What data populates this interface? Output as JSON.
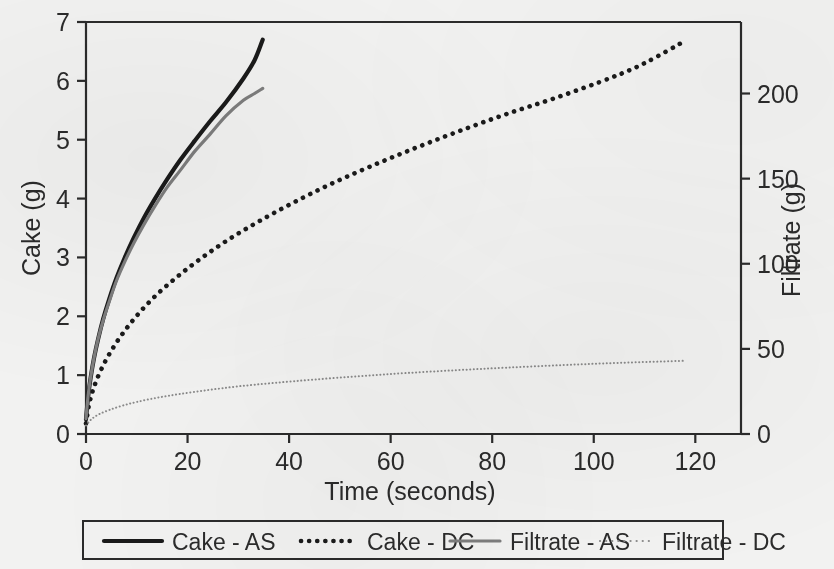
{
  "chart_data": {
    "type": "line",
    "title": "",
    "xlabel": "Time (seconds)",
    "ylabel": "Cake (g)",
    "y2label": "Filtrate (g)",
    "xlim": [
      0,
      129
    ],
    "ylim": [
      0,
      7
    ],
    "y2lim": [
      0,
      242
    ],
    "xticks": [
      0,
      20,
      40,
      60,
      80,
      100,
      120
    ],
    "yticks": [
      0,
      1,
      2,
      3,
      4,
      5,
      6,
      7
    ],
    "y2ticks": [
      0,
      50,
      100,
      150,
      200
    ],
    "grid": false,
    "legend_position": "bottom",
    "series": [
      {
        "name": "Cake - AS",
        "axis": "left",
        "style": "solid",
        "color": "#1a1a1a",
        "width": 4.2,
        "x": [
          0,
          0.4,
          0.9,
          1.6,
          2.4,
          3.4,
          4.6,
          6.0,
          7.6,
          9.4,
          11.4,
          13.6,
          16.0,
          18.6,
          21.4,
          24.4,
          27.6,
          31.0,
          33.2,
          34.8
        ],
        "y": [
          0.25,
          0.62,
          0.95,
          1.3,
          1.62,
          1.96,
          2.3,
          2.65,
          2.99,
          3.33,
          3.67,
          4.0,
          4.33,
          4.66,
          4.98,
          5.31,
          5.64,
          6.04,
          6.35,
          6.7
        ]
      },
      {
        "name": "Cake - DC",
        "axis": "left",
        "style": "dotted",
        "color": "#1a1a1a",
        "width": 4.6,
        "x": [
          0,
          0.6,
          1.5,
          2.8,
          4.6,
          7.0,
          10.0,
          13.6,
          17.8,
          22.6,
          28.0,
          34.0,
          40.6,
          47.8,
          55.6,
          64.0,
          73.0,
          82.6,
          92.8,
          103.6,
          110.0,
          118.0
        ],
        "y": [
          0.18,
          0.5,
          0.78,
          1.06,
          1.36,
          1.68,
          2.01,
          2.34,
          2.66,
          2.98,
          3.3,
          3.61,
          3.92,
          4.23,
          4.53,
          4.83,
          5.13,
          5.43,
          5.72,
          6.06,
          6.3,
          6.68
        ]
      },
      {
        "name": "Filtrate - AS",
        "axis": "right",
        "style": "solid",
        "color": "#7d7d7d",
        "width": 3.2,
        "x": [
          0,
          0.4,
          0.9,
          1.6,
          2.4,
          3.4,
          4.6,
          6.0,
          7.6,
          9.4,
          11.4,
          13.6,
          16.0,
          18.6,
          21.4,
          24.4,
          27.6,
          31.0,
          33.2,
          34.8
        ],
        "y": [
          9,
          22,
          33,
          45,
          56,
          67,
          78,
          90,
          101,
          112,
          123,
          134,
          145,
          155,
          166,
          176,
          187,
          196,
          200,
          203
        ]
      },
      {
        "name": "Filtrate - DC",
        "axis": "right",
        "style": "dotted",
        "color": "#8a8a8a",
        "width": 2.0,
        "x": [
          0,
          1.0,
          2.5,
          4.5,
          7.0,
          10.0,
          14.0,
          18.5,
          24.0,
          30.0,
          37.0,
          45.0,
          54.0,
          63.0,
          73.0,
          83.0,
          94.0,
          105.0,
          118.0
        ],
        "y": [
          5,
          8.5,
          11.5,
          14.0,
          16.5,
          18.8,
          21.3,
          23.5,
          25.8,
          28.0,
          30.0,
          32.0,
          34.0,
          35.8,
          37.5,
          39.0,
          40.5,
          41.8,
          43.0
        ]
      }
    ]
  },
  "axes": {
    "left": {
      "title": "Cake (g)",
      "tick_labels": [
        "0",
        "1",
        "2",
        "3",
        "4",
        "5",
        "6",
        "7"
      ]
    },
    "right": {
      "title": "Filtrate (g)",
      "tick_labels": [
        "0",
        "50",
        "100",
        "150",
        "200"
      ]
    },
    "bottom": {
      "title": "Time (seconds)",
      "tick_labels": [
        "0",
        "20",
        "40",
        "60",
        "80",
        "100",
        "120"
      ]
    }
  },
  "legend": {
    "items": [
      {
        "label": "Cake - AS",
        "swatch": "solid-thick-black"
      },
      {
        "label": "Cake - DC",
        "swatch": "dotted-thick-black"
      },
      {
        "label": "Filtrate - AS",
        "swatch": "solid-gray"
      },
      {
        "label": "Filtrate - DC",
        "swatch": "dotted-fine-gray"
      }
    ]
  }
}
